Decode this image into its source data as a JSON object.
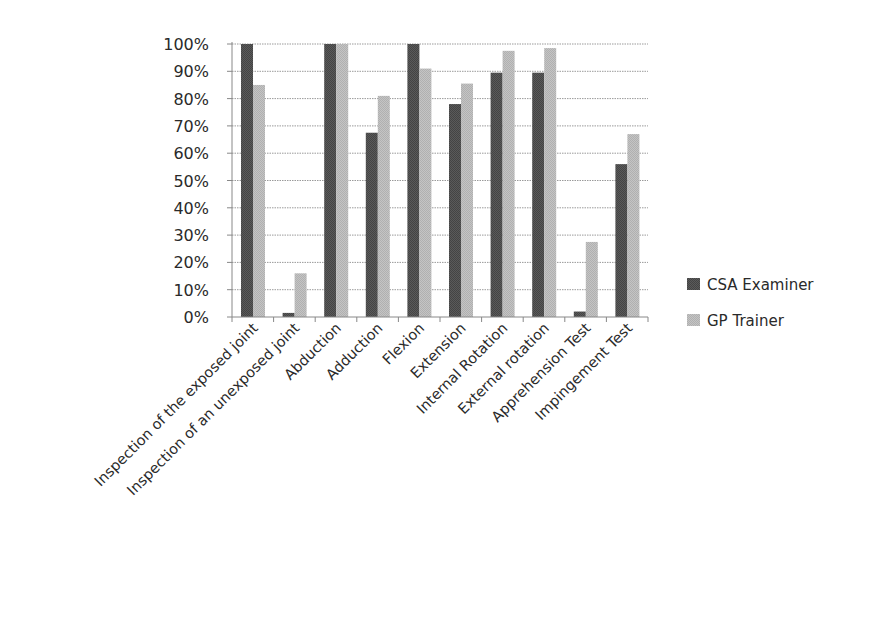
{
  "chart_data": {
    "type": "bar",
    "title": "",
    "xlabel": "",
    "ylabel": "",
    "ylim": [
      0,
      100
    ],
    "y_ticks": [
      "0%",
      "10%",
      "20%",
      "30%",
      "40%",
      "50%",
      "60%",
      "70%",
      "80%",
      "90%",
      "100%"
    ],
    "grid": true,
    "legend_position": "right",
    "categories": [
      "Inspection of the exposed joint",
      "Inspection of an unexposed joint",
      "Abduction",
      "Adduction",
      "Flexion",
      "Extension",
      "Internal Rotation",
      "External rotation",
      "Apprehension Test",
      "Impingement Test"
    ],
    "series": [
      {
        "name": "CSA Examiner",
        "color": "#555555",
        "values": [
          100,
          1.5,
          100,
          67.5,
          100,
          78,
          89.5,
          89.5,
          2,
          56
        ]
      },
      {
        "name": "GP Trainer",
        "color": "#bdbdbd",
        "values": [
          85,
          16,
          100,
          81,
          91,
          85.5,
          97.5,
          98.5,
          27.5,
          67
        ]
      }
    ]
  }
}
